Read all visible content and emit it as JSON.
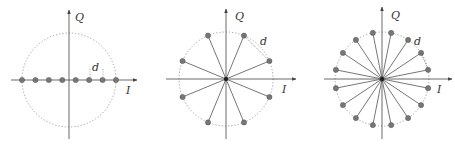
{
  "figure": {
    "panels": [
      {
        "name": "8-PAM",
        "center": [
          69,
          80
        ],
        "radius": 47,
        "points": 8,
        "layout": "line",
        "axis_x_label": "I",
        "axis_y_label": "Q",
        "distance_label": "d"
      },
      {
        "name": "8-PSK",
        "center": [
          226,
          79
        ],
        "radius": 47,
        "points": 8,
        "layout": "circle",
        "phase_offset_deg": 22.5,
        "axis_x_label": "I",
        "axis_y_label": "Q",
        "distance_label": "d"
      },
      {
        "name": "16-PSK",
        "center": [
          382,
          79
        ],
        "radius": 47,
        "points": 16,
        "layout": "circle",
        "phase_offset_deg": 11.25,
        "axis_x_label": "I",
        "axis_y_label": "Q",
        "distance_label": "d"
      }
    ],
    "colors": {
      "axis": "#444444",
      "circle": "#888888",
      "spoke": "#666666",
      "point": "#777777"
    }
  }
}
